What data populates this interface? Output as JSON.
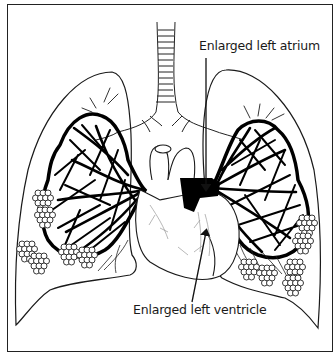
{
  "diagram": {
    "labels": {
      "atrium": "Enlarged left atrium",
      "ventricle": "Enlarged left ventricle"
    },
    "colors": {
      "line": "#1a1a1a",
      "vessels": "#000000",
      "background": "#ffffff",
      "fine_vessels": "#888888"
    },
    "structures": [
      "trachea",
      "left-lung",
      "right-lung",
      "pulmonary-vessels-left",
      "pulmonary-vessels-right",
      "alveoli-clusters",
      "heart",
      "aorta",
      "left-atrium",
      "left-ventricle"
    ],
    "arrows": [
      {
        "target": "left-atrium",
        "label_ref": "atrium"
      },
      {
        "target": "left-ventricle",
        "label_ref": "ventricle"
      }
    ]
  }
}
